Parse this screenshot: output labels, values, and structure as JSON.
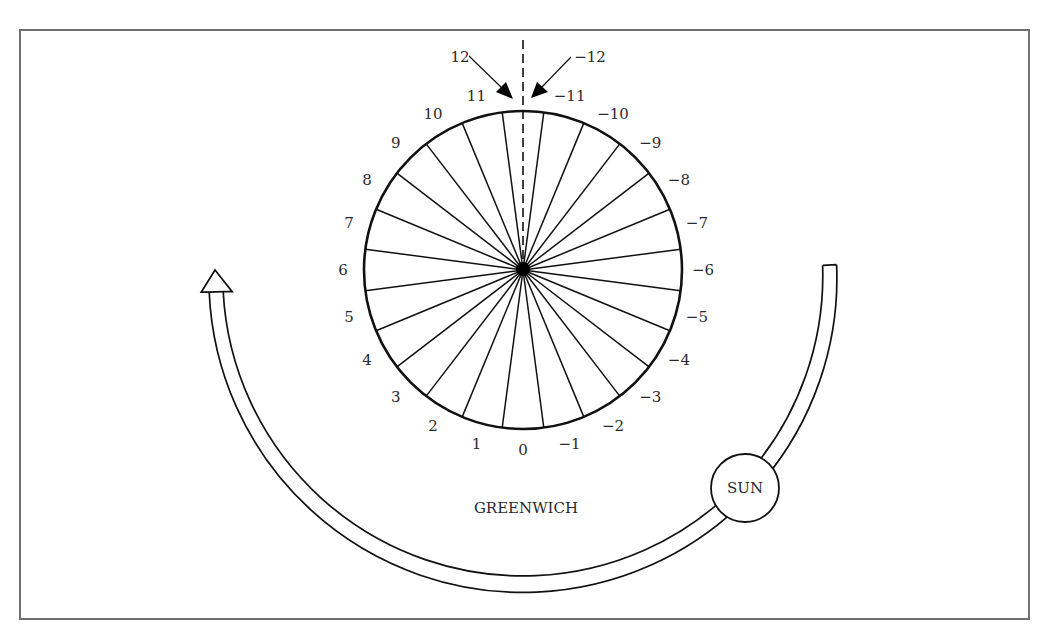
{
  "figure": {
    "frame": {
      "x": 20,
      "y": 30,
      "width": 1009,
      "height": 589
    },
    "dial": {
      "center": [
        523,
        270
      ],
      "radius": 159,
      "segments": 24,
      "label_radius": 180,
      "positive_labels": [
        "1",
        "2",
        "3",
        "4",
        "5",
        "6",
        "7",
        "8",
        "9",
        "10",
        "11"
      ],
      "negative_labels": [
        "−1",
        "−2",
        "−3",
        "−4",
        "−5",
        "−6",
        "−7",
        "−8",
        "−9",
        "−10",
        "−11"
      ],
      "zero_label": "0",
      "top_left_label": "12",
      "top_right_label": "−12"
    },
    "date_line": {
      "style": "dashed",
      "top_y": 40
    },
    "greenwich_label": "GREENWICH",
    "sun": {
      "label": "SUN",
      "center": [
        745,
        488
      ],
      "radius": 34
    },
    "orbit_arrow": {
      "center": [
        523,
        281
      ],
      "radius": 307,
      "width": 14,
      "direction": "counterclockwise",
      "icon": "arrow-up-icon"
    },
    "colors": {
      "line": "#111111",
      "frame": "#707070",
      "text": "#2a2a2a",
      "background": "#ffffff"
    }
  }
}
